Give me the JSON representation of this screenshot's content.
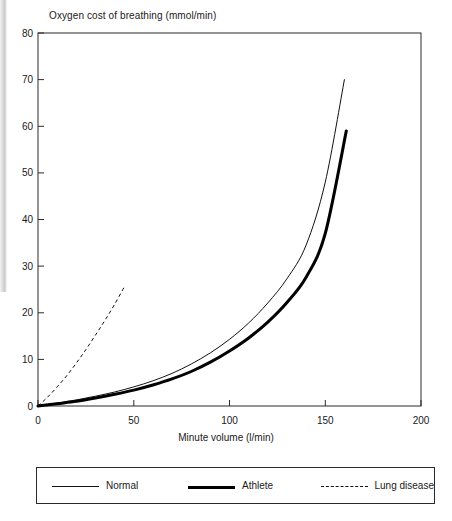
{
  "chart_data": {
    "type": "line",
    "title": "Oxygen cost of breathing (mmol/min)",
    "xlabel": "Minute volume (l/min)",
    "ylabel": "Oxygen cost of breathing (mmol/min)",
    "xlim": [
      0,
      200
    ],
    "ylim": [
      0,
      80
    ],
    "xticks": [
      0,
      50,
      100,
      150,
      200
    ],
    "yticks": [
      0,
      10,
      20,
      30,
      40,
      50,
      60,
      70,
      80
    ],
    "grid": false,
    "legend_position": "below-plot",
    "series": [
      {
        "name": "Normal",
        "style": "thin-solid",
        "color": "#111111",
        "x": [
          0,
          10,
          20,
          30,
          40,
          50,
          60,
          70,
          80,
          90,
          100,
          110,
          120,
          130,
          140,
          150,
          160
        ],
        "y": [
          0.0,
          0.6,
          1.3,
          2.1,
          3.0,
          4.1,
          5.4,
          7.0,
          9.0,
          11.4,
          14.3,
          17.8,
          22.1,
          27.3,
          34.5,
          48.0,
          70.0
        ]
      },
      {
        "name": "Athlete",
        "style": "thick-solid",
        "color": "#000000",
        "x": [
          0,
          10,
          20,
          30,
          40,
          50,
          60,
          70,
          80,
          90,
          100,
          110,
          120,
          130,
          140,
          150,
          161
        ],
        "y": [
          0.0,
          0.5,
          1.0,
          1.7,
          2.5,
          3.4,
          4.5,
          5.8,
          7.4,
          9.4,
          11.8,
          14.6,
          18.0,
          22.2,
          27.6,
          37.0,
          59.0
        ]
      },
      {
        "name": "Lung disease",
        "style": "dashed",
        "color": "#111111",
        "x": [
          0,
          5,
          10,
          15,
          20,
          25,
          30,
          35,
          40,
          45
        ],
        "y": [
          0.0,
          1.9,
          4.1,
          6.5,
          9.2,
          12.1,
          15.2,
          18.4,
          21.8,
          25.5
        ]
      }
    ]
  },
  "legend": {
    "items": [
      {
        "label": "Normal",
        "swatch": "thin-solid-line-icon"
      },
      {
        "label": "Athlete",
        "swatch": "thick-solid-line-icon"
      },
      {
        "label": "Lung disease",
        "swatch": "dashed-line-icon"
      }
    ]
  },
  "axis": {
    "y_tick_labels": [
      "80",
      "70",
      "60",
      "50",
      "40",
      "30",
      "20",
      "10",
      "0"
    ],
    "x_tick_labels": [
      "0",
      "50",
      "100",
      "150",
      "200"
    ]
  }
}
